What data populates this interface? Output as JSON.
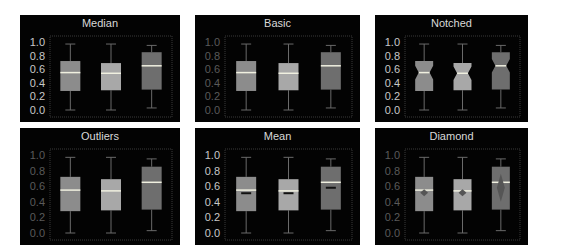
{
  "chart_data": [
    {
      "type": "box",
      "title": "Median",
      "variant": "median",
      "yticks": [
        "1.0",
        "0.8",
        "0.6",
        "0.4",
        "0.2",
        "0.0"
      ],
      "ylim": [
        0,
        1
      ],
      "tick_color": "#c8c8c8",
      "boxes": [
        {
          "q1": 0.28,
          "median": 0.55,
          "q3": 0.72,
          "whisker_low": 0.0,
          "whisker_high": 0.97,
          "color": "#8c8c8c"
        },
        {
          "q1": 0.29,
          "median": 0.54,
          "q3": 0.69,
          "whisker_low": 0.0,
          "whisker_high": 0.97,
          "color": "#a8a8a8"
        },
        {
          "q1": 0.3,
          "median": 0.65,
          "q3": 0.85,
          "whisker_low": 0.03,
          "whisker_high": 0.95,
          "color": "#6e6e6e"
        }
      ]
    },
    {
      "type": "box",
      "title": "Basic",
      "variant": "basic",
      "yticks": [
        "1.0",
        "0.8",
        "0.6",
        "0.4",
        "0.2",
        "0.0"
      ],
      "ylim": [
        0,
        1
      ],
      "tick_color": "#5a5a5a",
      "boxes": [
        {
          "q1": 0.28,
          "median": 0.55,
          "q3": 0.72,
          "whisker_low": 0.0,
          "whisker_high": 0.97,
          "color": "#8c8c8c"
        },
        {
          "q1": 0.29,
          "median": 0.54,
          "q3": 0.69,
          "whisker_low": 0.0,
          "whisker_high": 0.97,
          "color": "#a8a8a8"
        },
        {
          "q1": 0.3,
          "median": 0.65,
          "q3": 0.85,
          "whisker_low": 0.03,
          "whisker_high": 0.95,
          "color": "#6e6e6e"
        }
      ]
    },
    {
      "type": "box",
      "title": "Notched",
      "variant": "notched",
      "yticks": [
        "1.0",
        "0.8",
        "0.6",
        "0.4",
        "0.2",
        "0.0"
      ],
      "ylim": [
        0,
        1
      ],
      "tick_color": "#c8c8c8",
      "boxes": [
        {
          "q1": 0.28,
          "median": 0.55,
          "q3": 0.72,
          "whisker_low": 0.0,
          "whisker_high": 0.97,
          "color": "#8c8c8c"
        },
        {
          "q1": 0.29,
          "median": 0.54,
          "q3": 0.69,
          "whisker_low": 0.0,
          "whisker_high": 0.97,
          "color": "#a8a8a8"
        },
        {
          "q1": 0.3,
          "median": 0.65,
          "q3": 0.85,
          "whisker_low": 0.03,
          "whisker_high": 0.95,
          "color": "#6e6e6e"
        }
      ]
    },
    {
      "type": "box",
      "title": "Outliers",
      "variant": "outliers",
      "yticks": [
        "1.0",
        "0.8",
        "0.6",
        "0.4",
        "0.2",
        "0.0"
      ],
      "ylim": [
        0,
        1
      ],
      "tick_color": "#5a5a5a",
      "boxes": [
        {
          "q1": 0.28,
          "median": 0.55,
          "q3": 0.72,
          "whisker_low": 0.0,
          "whisker_high": 0.97,
          "color": "#8c8c8c"
        },
        {
          "q1": 0.29,
          "median": 0.54,
          "q3": 0.69,
          "whisker_low": 0.0,
          "whisker_high": 0.97,
          "color": "#a8a8a8"
        },
        {
          "q1": 0.3,
          "median": 0.65,
          "q3": 0.85,
          "whisker_low": 0.03,
          "whisker_high": 0.95,
          "color": "#6e6e6e"
        }
      ]
    },
    {
      "type": "box",
      "title": "Mean",
      "variant": "mean",
      "yticks": [
        "1.0",
        "0.8",
        "0.6",
        "0.4",
        "0.2",
        "0.0"
      ],
      "ylim": [
        0,
        1
      ],
      "tick_color": "#c8c8c8",
      "boxes": [
        {
          "q1": 0.28,
          "median": 0.55,
          "q3": 0.72,
          "whisker_low": 0.0,
          "whisker_high": 0.97,
          "mean": 0.51,
          "color": "#8c8c8c"
        },
        {
          "q1": 0.29,
          "median": 0.54,
          "q3": 0.69,
          "whisker_low": 0.0,
          "whisker_high": 0.97,
          "mean": 0.51,
          "color": "#a8a8a8"
        },
        {
          "q1": 0.3,
          "median": 0.65,
          "q3": 0.85,
          "whisker_low": 0.03,
          "whisker_high": 0.95,
          "mean": 0.58,
          "color": "#6e6e6e"
        }
      ]
    },
    {
      "type": "box",
      "title": "Diamond",
      "variant": "diamond",
      "yticks": [
        "1.0",
        "0.8",
        "0.6",
        "0.4",
        "0.2",
        "0.0"
      ],
      "ylim": [
        0,
        1
      ],
      "tick_color": "#5a5a5a",
      "boxes": [
        {
          "q1": 0.28,
          "median": 0.55,
          "q3": 0.72,
          "whisker_low": 0.0,
          "whisker_high": 0.97,
          "mean": 0.51,
          "diamond_low": 0.47,
          "diamond_high": 0.56,
          "color": "#8c8c8c"
        },
        {
          "q1": 0.29,
          "median": 0.54,
          "q3": 0.69,
          "whisker_low": 0.0,
          "whisker_high": 0.97,
          "mean": 0.51,
          "diamond_low": 0.47,
          "diamond_high": 0.56,
          "color": "#a8a8a8"
        },
        {
          "q1": 0.3,
          "median": 0.65,
          "q3": 0.85,
          "whisker_low": 0.03,
          "whisker_high": 0.95,
          "mean": 0.58,
          "diamond_low": 0.4,
          "diamond_high": 0.76,
          "color": "#6e6e6e"
        }
      ]
    }
  ],
  "colors": {
    "panel_bg": "#030303",
    "page_bg": "#ffffff",
    "title": "#d9d9d9",
    "median_line": "#f0f0e0",
    "whisker": "#6a6a6a",
    "frame": "#3a3a3a",
    "mean_marker": "#111111",
    "diamond": "#555555"
  }
}
